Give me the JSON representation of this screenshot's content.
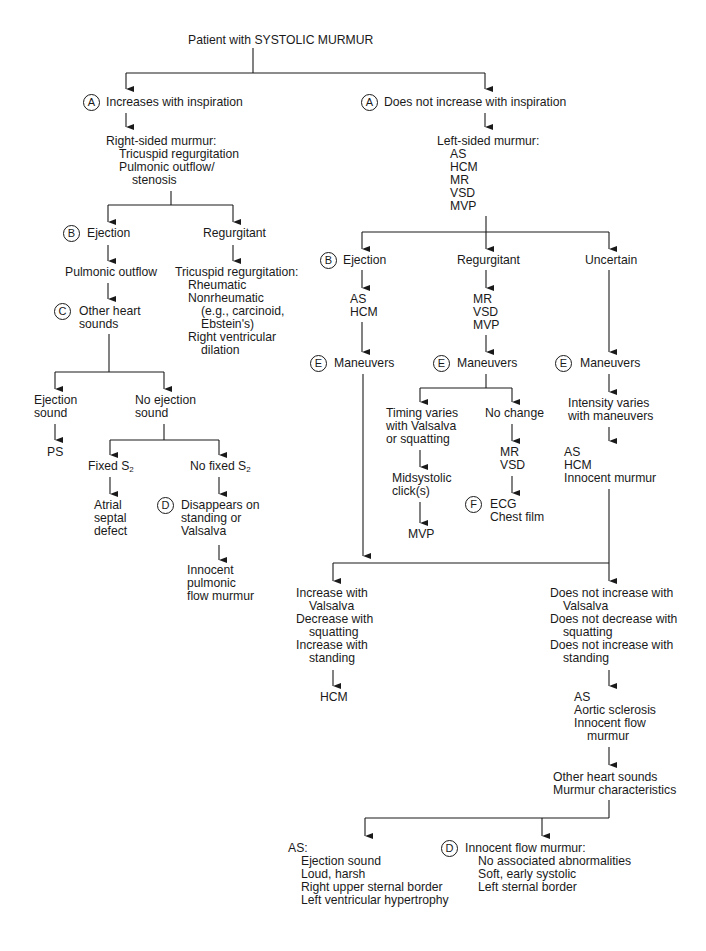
{
  "title": "Patient with SYSTOLIC MURMUR",
  "left": {
    "label_letter": "A",
    "condition": "Increases with inspiration",
    "summary": [
      "Right-sided murmur:",
      "Tricuspid regurgitation",
      "Pulmonic outflow/",
      "stenosis"
    ],
    "ejection": {
      "letter": "B",
      "label": "Ejection",
      "next": "Pulmonic outflow",
      "other_letter": "C",
      "other": [
        "Other heart",
        "sounds"
      ],
      "ejection_sound": [
        "Ejection",
        "sound"
      ],
      "ejection_sound_result": "PS",
      "no_ejection_sound": [
        "No ejection",
        "sound"
      ],
      "fixed_s2": "Fixed S",
      "fixed_s2_sub": "2",
      "fixed_s2_result": [
        "Atrial",
        "septal",
        "defect"
      ],
      "no_fixed_s2": "No fixed S",
      "no_fixed_s2_sub": "2",
      "disappears_letter": "D",
      "disappears": [
        "Disappears on",
        "standing or",
        "Valsalva"
      ],
      "innocent": [
        "Innocent",
        "pulmonic",
        "flow murmur"
      ]
    },
    "regurgitant": {
      "label": "Regurgitant",
      "detail": [
        "Tricuspid regurgitation:",
        "Rheumatic",
        "Nonrheumatic",
        "(e.g., carcinoid,",
        "Ebstein's)",
        "Right ventricular",
        "dilation"
      ]
    }
  },
  "right": {
    "label_letter": "A",
    "condition": "Does not increase with inspiration",
    "summary": [
      "Left-sided murmur:",
      "AS",
      "HCM",
      "MR",
      "VSD",
      "MVP"
    ],
    "ejection": {
      "letter": "B",
      "label": "Ejection",
      "dx": [
        "AS",
        "HCM"
      ],
      "man_letter": "E",
      "maneuvers": "Maneuvers"
    },
    "regurgitant": {
      "label": "Regurgitant",
      "dx": [
        "MR",
        "VSD",
        "MVP"
      ],
      "man_letter": "E",
      "maneuvers": "Maneuvers",
      "timing": [
        "Timing varies",
        "with Valsalva",
        "or squatting"
      ],
      "click": [
        "Midsystolic",
        "click(s)"
      ],
      "click_result": "MVP",
      "no_change": "No change",
      "no_change_dx": [
        "MR",
        "VSD"
      ],
      "tests_letter": "F",
      "tests": [
        "ECG",
        "Chest film"
      ]
    },
    "uncertain": {
      "label": "Uncertain",
      "man_letter": "E",
      "maneuvers": "Maneuvers",
      "intensity": [
        "Intensity varies",
        "with maneuvers"
      ],
      "dx": [
        "AS",
        "HCM",
        "Innocent murmur"
      ]
    },
    "increase": [
      "Increase with",
      "Valsalva",
      "Decrease with",
      "squatting",
      "Increase with",
      "standing"
    ],
    "increase_result": "HCM",
    "not_increase": [
      "Does not increase with",
      "Valsalva",
      "Does not decrease with",
      "squatting",
      "Does not increase with",
      "standing"
    ],
    "not_increase_dx": [
      "AS",
      "Aortic sclerosis",
      "Innocent flow",
      "murmur"
    ],
    "further": [
      "Other heart sounds",
      "Murmur characteristics"
    ],
    "as_detail": [
      "AS:",
      "Ejection sound",
      "Loud, harsh",
      "Right upper sternal border",
      "Left ventricular hypertrophy"
    ],
    "innocent_letter": "D",
    "innocent_detail": [
      "Innocent flow murmur:",
      "No associated abnormalities",
      "Soft, early systolic",
      "Left sternal border"
    ]
  }
}
